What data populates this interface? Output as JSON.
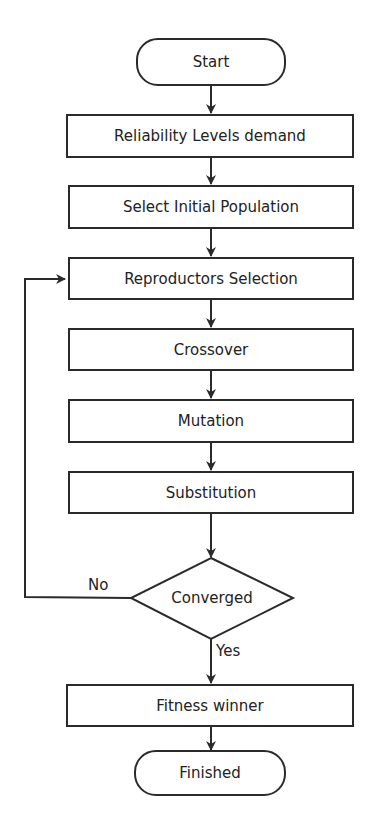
{
  "flowchart": {
    "start": "Start",
    "steps": [
      "Reliability Levels demand",
      "Select Initial Population",
      "Reproductors Selection",
      "Crossover",
      "Mutation",
      "Substitution"
    ],
    "decision": "Converged",
    "no_label": "No",
    "yes_label": "Yes",
    "final_step": "Fitness winner",
    "end": "Finished"
  },
  "colors": {
    "stroke": "#2a2a2a",
    "background": "#ffffff"
  }
}
